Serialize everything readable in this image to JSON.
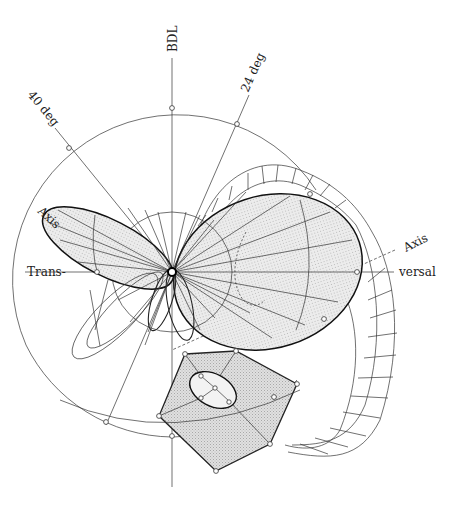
{
  "diagram": {
    "type": "polar directional radiation / axis diagram",
    "labels": {
      "top_axis": "BDL",
      "angle_a": "40 deg",
      "angle_b": "24 deg",
      "left_axis_upper": "Axis",
      "left_axis": "Trans-",
      "right_axis_upper": "Axis",
      "right_axis": "versal"
    },
    "colors": {
      "line": "#222222",
      "fill_lobe": "#e4e4e4",
      "fill_hexagon": "#dcdcdc",
      "background": "#ffffff"
    },
    "geometry": {
      "center": [
        172,
        272
      ],
      "outer_circle_radius": 165,
      "inner_circle_radius": 60,
      "hexagon_vertices": [
        [
          185,
          354
        ],
        [
          236,
          351
        ],
        [
          297,
          384
        ],
        [
          270,
          444
        ],
        [
          216,
          471
        ],
        [
          159,
          416
        ]
      ]
    }
  }
}
